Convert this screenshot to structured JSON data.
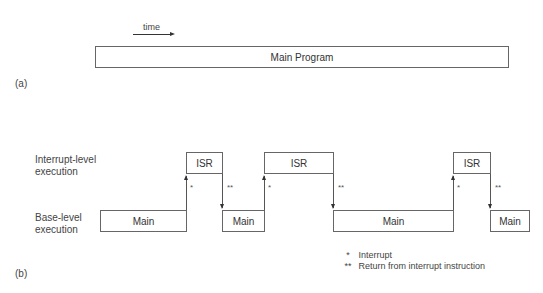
{
  "part_a": {
    "label": "(a)",
    "time_label": "time",
    "main_program": "Main Program"
  },
  "part_b": {
    "label": "(b)",
    "interrupt_level": "Interrupt-level\nexecution",
    "interrupt_level_line1": "Interrupt-level",
    "interrupt_level_line2": "execution",
    "base_level_line1": "Base-level",
    "base_level_line2": "execution",
    "main_blocks": [
      "Main",
      "Main",
      "Main",
      "Main"
    ],
    "isr_blocks": [
      "ISR",
      "ISR",
      "ISR"
    ],
    "interrupt_mark": "*",
    "return_mark": "**"
  },
  "legend": {
    "items": [
      {
        "symbol": "*",
        "text": "Interrupt"
      },
      {
        "symbol": "**",
        "text": "Return from interrupt instruction"
      }
    ]
  }
}
